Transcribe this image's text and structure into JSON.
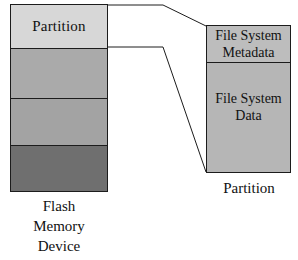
{
  "figure": {
    "type": "diagram"
  },
  "flash_device": {
    "caption_lines": [
      "Flash",
      "Memory",
      "Device"
    ],
    "segments": [
      {
        "label": "Partition",
        "fill": "#d7d7d7"
      },
      {
        "label": "",
        "fill": "#aaaaaa"
      },
      {
        "label": "",
        "fill": "#a3a3a3"
      },
      {
        "label": "",
        "fill": "#6f6f6f"
      }
    ]
  },
  "partition_detail": {
    "caption": "Partition",
    "segments": [
      {
        "lines": [
          "File System",
          "Metadata"
        ],
        "fill": "#bdbdbd"
      },
      {
        "lines": [
          "File System",
          "Data"
        ],
        "fill": "#b6b6b6"
      }
    ]
  },
  "connectors": {
    "stroke": "#1c1c1c",
    "top_callout": "leader line from top of partition segment to top-left of detail box",
    "bottom_callout": "leader line from bottom of partition segment to bottom-left of detail box"
  },
  "colors": {
    "background": "#ffffff",
    "outline": "#1c1c1c",
    "text": "#111111"
  }
}
